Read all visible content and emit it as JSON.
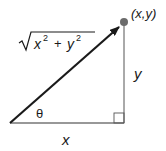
{
  "diagram": {
    "type": "right-triangle-vector",
    "point_label": "(x,y)",
    "hypotenuse_label": "√(x² + y²)",
    "hypotenuse_parts": {
      "radicand": "x",
      "plus": "+",
      "radicand2": "y",
      "exp": "2"
    },
    "vertical_side_label": "y",
    "horizontal_side_label": "x",
    "angle_label": "θ",
    "right_angle_marker": true,
    "colors": {
      "line": "#1a1a1a",
      "thin_line": "#555555",
      "dot": "#6b6b6b"
    }
  }
}
